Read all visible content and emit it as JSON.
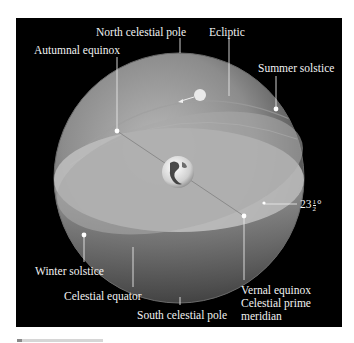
{
  "diagram": {
    "labels": {
      "north_celestial_pole": "North celestial pole",
      "ecliptic": "Ecliptic",
      "autumnal_equinox": "Autumnal equinox",
      "summer_solstice": "Summer solstice",
      "tilt_whole": "23",
      "tilt_frac_num": "1",
      "tilt_frac_den": "2",
      "tilt_degree": "°",
      "winter_solstice": "Winter solstice",
      "celestial_equator": "Celestial equator",
      "south_celestial_pole": "South celestial pole",
      "vernal_equinox": "Vernal equinox",
      "celestial_prime": "Celestial prime",
      "meridian": "meridian"
    },
    "colors": {
      "background": "#000000",
      "label_text": "#f2f2f2",
      "leader_line": "#e6e6e6",
      "sphere_light": "#cfcfcf",
      "sphere_dark": "#3a3a3a",
      "equator_plane": "#b9b9b9",
      "ecliptic_plane": "#a6a6a6"
    }
  }
}
